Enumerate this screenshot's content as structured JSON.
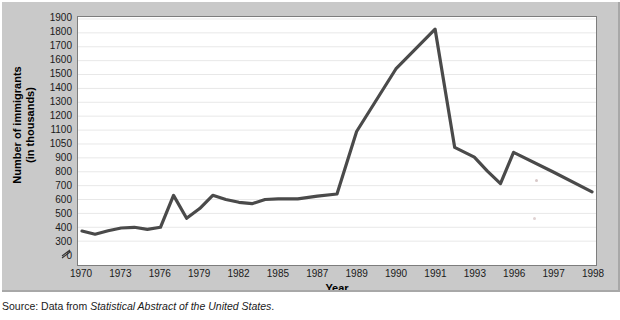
{
  "figure": {
    "background_color": "#c9c9c9",
    "plot_background_color": "#ffffff",
    "line_color": "#4a4a4a",
    "gridline_color": "#e8e8e8",
    "axis_break_symbol": "//"
  },
  "source_note": {
    "prefix": "Source: Data from ",
    "italic_title": "Statistical Abstract of the United States",
    "suffix": "."
  },
  "chart_data": {
    "type": "line",
    "title": "",
    "xlabel": "Year",
    "ylabel": "Number of immigrants\n(in thousands)",
    "ylabel_line1": "Number of immigrants",
    "ylabel_line2": "(in thousands)",
    "ytick_labels": [
      "1900",
      "1800",
      "1700",
      "1600",
      "1500",
      "1400",
      "1300",
      "1200",
      "1100",
      "1050",
      "900",
      "800",
      "700",
      "600",
      "500",
      "400",
      "300",
      "0"
    ],
    "ytick_values": [
      1900,
      1800,
      1700,
      1600,
      1500,
      1400,
      1300,
      1200,
      1100,
      1050,
      900,
      800,
      700,
      600,
      500,
      400,
      300,
      0
    ],
    "yaxis_broken": true,
    "yaxis_break_between": [
      300,
      0
    ],
    "ylim": [
      300,
      1900
    ],
    "xtick_labels": [
      "1970",
      "1973",
      "1976",
      "1979",
      "1982",
      "1985",
      "1987",
      "1989",
      "1990",
      "1991",
      "1993",
      "1996",
      "1997",
      "1998"
    ],
    "grid": true,
    "grid_axis": "y",
    "legend": false,
    "x": [
      1970,
      1971,
      1972,
      1973,
      1974,
      1975,
      1976,
      1977,
      1978,
      1979,
      1980,
      1981,
      1982,
      1983,
      1984,
      1985,
      1986,
      1987,
      1988,
      1989,
      1990,
      1991,
      1992,
      1993,
      1994,
      1995,
      1996,
      1997,
      1998
    ],
    "categories": [
      "1970",
      "1971",
      "1972",
      "1973",
      "1974",
      "1975",
      "1976",
      "1977",
      "1978",
      "1979",
      "1980",
      "1981",
      "1982",
      "1983",
      "1984",
      "1985",
      "1986",
      "1987",
      "1988",
      "1989",
      "1990",
      "1991",
      "1992",
      "1993",
      "1994",
      "1995",
      "1996",
      "1997",
      "1998"
    ],
    "values": [
      373,
      350,
      375,
      395,
      400,
      385,
      400,
      630,
      465,
      535,
      630,
      600,
      580,
      570,
      600,
      605,
      605,
      625,
      640,
      1090,
      1540,
      1827,
      975,
      905,
      805,
      715,
      940,
      800,
      655
    ],
    "series": [
      {
        "name": "Number of immigrants (in thousands)",
        "values": [
          373,
          350,
          375,
          395,
          400,
          385,
          400,
          630,
          465,
          535,
          630,
          600,
          580,
          570,
          600,
          605,
          605,
          625,
          640,
          1090,
          1540,
          1827,
          975,
          905,
          805,
          715,
          940,
          800,
          655
        ]
      }
    ],
    "peak": {
      "year": 1991,
      "value": 1827
    }
  }
}
